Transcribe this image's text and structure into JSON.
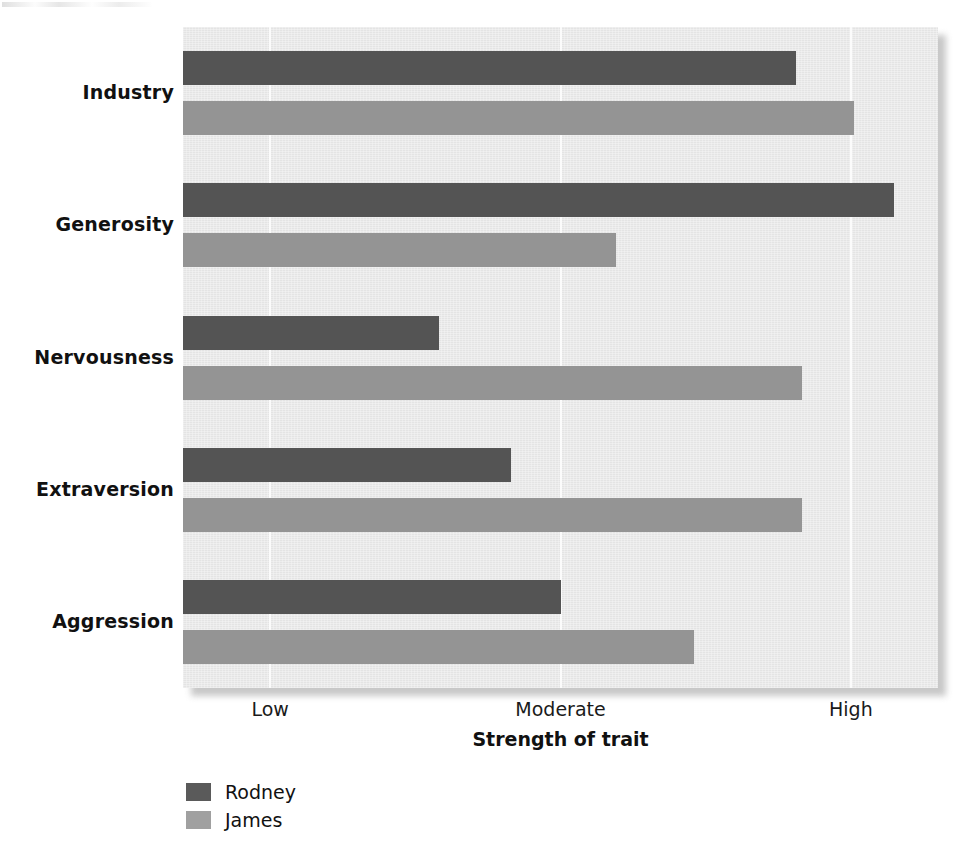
{
  "chart_data": {
    "type": "bar",
    "orientation": "horizontal",
    "title": "",
    "xlabel": "Strength of trait",
    "ylabel": "",
    "categories": [
      "Industry",
      "Generosity",
      "Nervousness",
      "Extraversion",
      "Aggression"
    ],
    "series": [
      {
        "name": "Rodney",
        "color": "#545454",
        "values": [
          2.81,
          3.15,
          1.58,
          1.83,
          2.0
        ]
      },
      {
        "name": "James",
        "color": "#949494",
        "values": [
          3.01,
          2.19,
          2.83,
          2.83,
          2.46
        ]
      }
    ],
    "x_tick_labels": [
      "Low",
      "Moderate",
      "High"
    ],
    "x_tick_values": [
      1,
      2,
      3
    ],
    "xlim": [
      0.7,
      3.3
    ],
    "grid": "vertical-only",
    "legend_position": "below-left",
    "plot_background": "#e9e9e9",
    "gridline_color": "#fbfbfb"
  }
}
